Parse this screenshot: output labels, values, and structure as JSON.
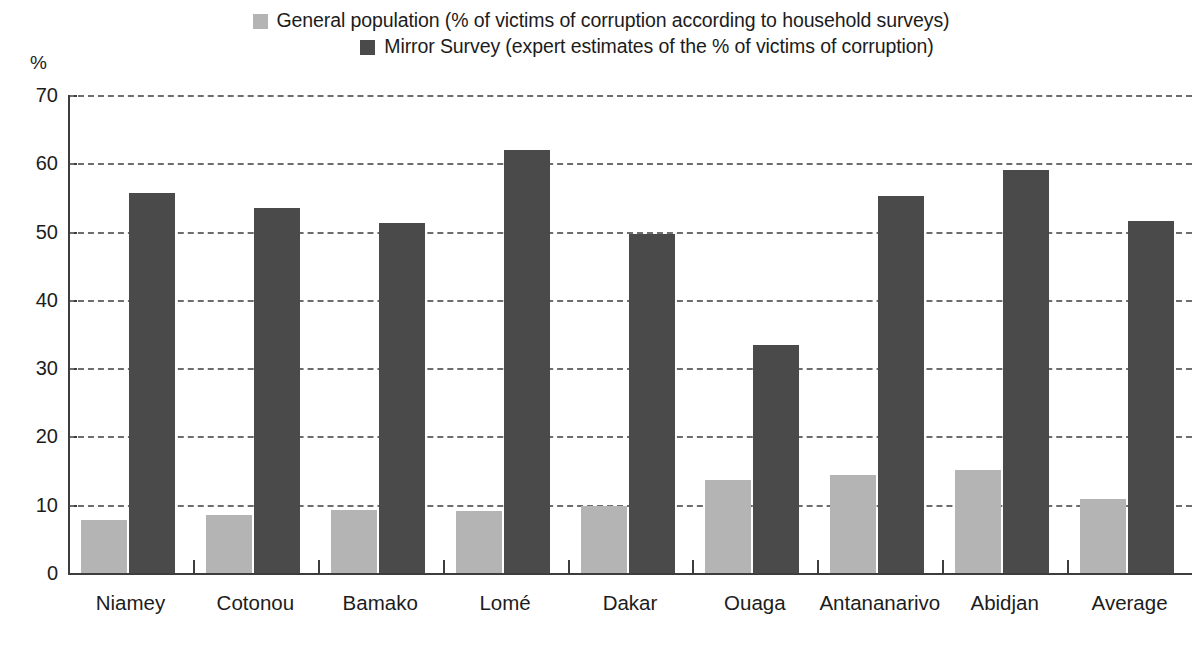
{
  "unit_label": "%",
  "legend": {
    "items": [
      {
        "label": "General population (% of victims of corruption according to household surveys)",
        "color": "#b4b4b4",
        "swatch_name": "legend-swatch-general-population"
      },
      {
        "label": "Mirror Survey (expert estimates of the % of victims of corruption)",
        "color": "#4a4a4a",
        "swatch_name": "legend-swatch-mirror-survey"
      }
    ]
  },
  "axis": {
    "y_ticks": [
      "70",
      "60",
      "50",
      "40",
      "30",
      "20",
      "10",
      "0"
    ]
  },
  "chart_data": {
    "type": "bar",
    "title": "",
    "xlabel": "",
    "ylabel": "%",
    "ylim": [
      0,
      70
    ],
    "ytick_step": 10,
    "grid": true,
    "legend_position": "top-center",
    "categories": [
      "Niamey",
      "Cotonou",
      "Bamako",
      "Lomé",
      "Dakar",
      "Ouaga",
      "Antananarivo",
      "Abidjan",
      "Average"
    ],
    "series": [
      {
        "name": "General population (% of victims of corruption according to household surveys)",
        "color": "#b4b4b4",
        "values": [
          7.7,
          8.5,
          9.2,
          9.1,
          9.8,
          13.6,
          14.3,
          15.1,
          10.8
        ]
      },
      {
        "name": "Mirror Survey (expert estimates of the % of victims of corruption)",
        "color": "#4a4a4a",
        "values": [
          55.7,
          53.5,
          51.2,
          62.0,
          49.7,
          33.4,
          55.2,
          59.0,
          51.6
        ]
      }
    ]
  }
}
